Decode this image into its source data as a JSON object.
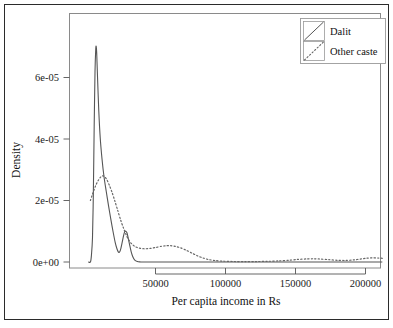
{
  "chart_data": {
    "type": "line",
    "title": "",
    "subtitle": "",
    "xlabel": "Per capita income in Rs",
    "ylabel": "Density",
    "xlim": [
      0,
      215000
    ],
    "ylim": [
      0,
      7.1e-05
    ],
    "xticks": [
      50000,
      100000,
      150000,
      200000
    ],
    "xticklabels": [
      "50000",
      "100000",
      "150000",
      "200000"
    ],
    "yticks": [
      0,
      2e-05,
      4e-05,
      6e-05
    ],
    "yticklabels": [
      "0e+00",
      "2e-05",
      "4e-05",
      "6e-05"
    ],
    "grid": false,
    "legend_position": "top-right",
    "legend_entries": [
      {
        "label": "Dalit",
        "linestyle": "solid",
        "color": "#555555"
      },
      {
        "label": "Other caste",
        "linestyle": "dotted",
        "color": "#666666"
      }
    ],
    "series": [
      {
        "name": "Dalit",
        "linestyle": "solid",
        "color": "#555555",
        "points": [
          [
            2000,
            0.0
          ],
          [
            3500,
            0.0
          ],
          [
            4200,
            2e-06
          ],
          [
            5000,
            8e-06
          ],
          [
            5600,
            2.2e-05
          ],
          [
            6200,
            4.4e-05
          ],
          [
            6800,
            6.2e-05
          ],
          [
            7300,
            6.9e-05
          ],
          [
            7600,
            7.02e-05
          ],
          [
            8000,
            6.8e-05
          ],
          [
            8600,
            6e-05
          ],
          [
            9500,
            4.9e-05
          ],
          [
            10500,
            4.05e-05
          ],
          [
            11800,
            3.35e-05
          ],
          [
            13200,
            2.78e-05
          ],
          [
            14800,
            2.3e-05
          ],
          [
            16500,
            1.82e-05
          ],
          [
            18200,
            1.36e-05
          ],
          [
            19800,
            9.6e-06
          ],
          [
            21200,
            6.4e-06
          ],
          [
            22400,
            4.4e-06
          ],
          [
            23400,
            3.3e-06
          ],
          [
            24300,
            3.2e-06
          ],
          [
            25200,
            4.3e-06
          ],
          [
            26200,
            6.4e-06
          ],
          [
            27200,
            8.6e-06
          ],
          [
            28000,
            9.8e-06
          ],
          [
            28800,
            1e-05
          ],
          [
            29600,
            9.5e-06
          ],
          [
            30500,
            7.8e-06
          ],
          [
            31500,
            5.6e-06
          ],
          [
            32600,
            3.4e-06
          ],
          [
            33800,
            1.7e-06
          ],
          [
            35200,
            6e-07
          ],
          [
            37000,
            1.5e-07
          ],
          [
            39000,
            3e-08
          ],
          [
            42000,
            0.0
          ],
          [
            60000,
            0.0
          ],
          [
            100000,
            0.0
          ],
          [
            150000,
            0.0
          ],
          [
            212000,
            0.0
          ]
        ]
      },
      {
        "name": "Other caste",
        "linestyle": "dotted",
        "color": "#666666",
        "points": [
          [
            3500,
            2e-05
          ],
          [
            4800,
            2.18e-05
          ],
          [
            6200,
            2.36e-05
          ],
          [
            7600,
            2.52e-05
          ],
          [
            9200,
            2.66e-05
          ],
          [
            10800,
            2.76e-05
          ],
          [
            12200,
            2.8e-05
          ],
          [
            13600,
            2.78e-05
          ],
          [
            15200,
            2.68e-05
          ],
          [
            17000,
            2.5e-05
          ],
          [
            19000,
            2.26e-05
          ],
          [
            21000,
            1.98e-05
          ],
          [
            23000,
            1.68e-05
          ],
          [
            25000,
            1.38e-05
          ],
          [
            27000,
            1.12e-05
          ],
          [
            29000,
            8.9e-06
          ],
          [
            31000,
            7.1e-06
          ],
          [
            33000,
            5.9e-06
          ],
          [
            35500,
            5e-06
          ],
          [
            38500,
            4.5e-06
          ],
          [
            42000,
            4.3e-06
          ],
          [
            46000,
            4.4e-06
          ],
          [
            50000,
            4.7e-06
          ],
          [
            54000,
            5.1e-06
          ],
          [
            58000,
            5.3e-06
          ],
          [
            61000,
            5.3e-06
          ],
          [
            64000,
            5.1e-06
          ],
          [
            68000,
            4.6e-06
          ],
          [
            72000,
            3.8e-06
          ],
          [
            76000,
            2.9e-06
          ],
          [
            80000,
            2e-06
          ],
          [
            84000,
            1.3e-06
          ],
          [
            88000,
            8e-07
          ],
          [
            93000,
            4.5e-07
          ],
          [
            99000,
            2.5e-07
          ],
          [
            106000,
            1.6e-07
          ],
          [
            114000,
            1.3e-07
          ],
          [
            122000,
            1.5e-07
          ],
          [
            130000,
            2.2e-07
          ],
          [
            138000,
            3.6e-07
          ],
          [
            146000,
            6e-07
          ],
          [
            152000,
            8.5e-07
          ],
          [
            158000,
            1e-06
          ],
          [
            163000,
            1.05e-06
          ],
          [
            168000,
            9.5e-07
          ],
          [
            174000,
            7.5e-07
          ],
          [
            180000,
            5.5e-07
          ],
          [
            186000,
            5e-07
          ],
          [
            192000,
            7e-07
          ],
          [
            197000,
            1e-06
          ],
          [
            201000,
            1.25e-06
          ],
          [
            205000,
            1.35e-06
          ],
          [
            209000,
            1.3e-06
          ],
          [
            212000,
            1.2e-06
          ]
        ]
      }
    ]
  },
  "axes": {
    "ylabel": "Density",
    "xlabel": "Per capita income in Rs",
    "ytick_0": "0e+00",
    "ytick_1": "2e-05",
    "ytick_2": "4e-05",
    "ytick_3": "6e-05",
    "xtick_0": "50000",
    "xtick_1": "100000",
    "xtick_2": "150000",
    "xtick_3": "200000"
  },
  "legend": {
    "entry_0_label": "Dalit",
    "entry_1_label": "Other caste"
  },
  "colors": {
    "frame": "#2b2b2b",
    "plot_box": "#8a8a8a",
    "dalit_line": "#555555",
    "other_caste_line": "#666666",
    "text": "#111111"
  }
}
